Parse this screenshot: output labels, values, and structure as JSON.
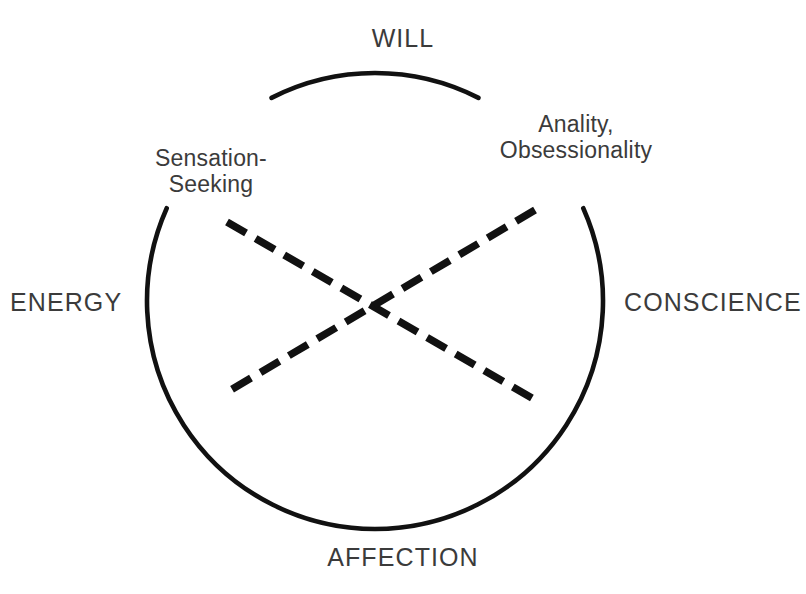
{
  "diagram": {
    "type": "circumplex-diagram",
    "canvas": {
      "width": 806,
      "height": 594,
      "background": "#ffffff"
    },
    "stroke_color": "#111111",
    "text_color": "#3b3b3b",
    "circle": {
      "center_x": 375,
      "center_y": 301,
      "radius": 228,
      "stroke_width": 4.6,
      "gaps": [
        {
          "name": "upper-left-gap",
          "start_deg": 117,
          "end_deg": 156
        },
        {
          "name": "upper-right-gap",
          "start_deg": 24,
          "end_deg": 63
        }
      ]
    },
    "poles": [
      {
        "id": "will",
        "label": "WILL",
        "position": "top"
      },
      {
        "id": "conscience",
        "label": "CONSCIENCE",
        "position": "right"
      },
      {
        "id": "affection",
        "label": "AFFECTION",
        "position": "bottom"
      },
      {
        "id": "energy",
        "label": "ENERGY",
        "position": "left"
      }
    ],
    "traits": [
      {
        "id": "sensation-seeking",
        "position": "upper-left",
        "lines": [
          "Sensation-",
          "Seeking"
        ]
      },
      {
        "id": "anality-obsessionality",
        "position": "upper-right",
        "lines": [
          "Anality,",
          "Obsessionality"
        ]
      }
    ],
    "dashed_axes": [
      {
        "id": "sensation-seeking-axis",
        "x1": 227,
        "y1": 222,
        "x2": 532,
        "y2": 398,
        "stroke_width": 7.5,
        "dash": "22 11"
      },
      {
        "id": "anality-obsessionality-axis",
        "x1": 535,
        "y1": 210,
        "x2": 224,
        "y2": 394,
        "stroke_width": 7.5,
        "dash": "22 11"
      }
    ],
    "crossing_point": {
      "x": 375,
      "y": 305
    }
  }
}
